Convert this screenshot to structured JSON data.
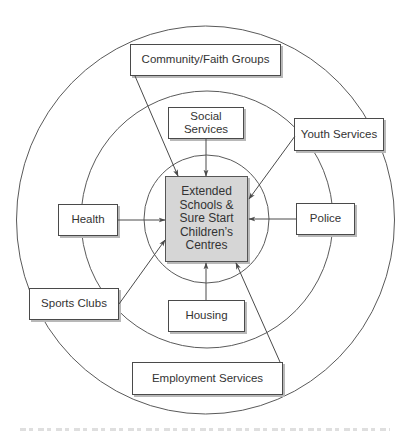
{
  "diagram": {
    "type": "concentric-hub-and-spoke",
    "colors": {
      "line": "#4a4a4a",
      "box_fill": "#ffffff",
      "center_fill": "#d6d6d6",
      "shadow": "#b8b8b8"
    },
    "rings": [
      {
        "name": "outer",
        "cx": 205.5,
        "cy": 220,
        "rx": 189,
        "ry": 194
      },
      {
        "name": "middle",
        "cx": 207,
        "cy": 219.5,
        "rx": 126,
        "ry": 128.5
      },
      {
        "name": "inner",
        "cx": 206.5,
        "cy": 219,
        "rx": 62.5,
        "ry": 64
      }
    ],
    "center": {
      "lines": [
        "Extended",
        "Schools &",
        "Sure Start",
        "Children’s",
        "Centres"
      ]
    },
    "nodes": [
      {
        "id": "community-faith-groups",
        "label": "Community/Faith Groups",
        "ring": "outer"
      },
      {
        "id": "social-services",
        "label": "Social Services",
        "ring": "middle"
      },
      {
        "id": "youth-services",
        "label": "Youth Services",
        "ring": "middle/outer"
      },
      {
        "id": "health",
        "label": "Health",
        "ring": "middle"
      },
      {
        "id": "police",
        "label": "Police",
        "ring": "middle"
      },
      {
        "id": "sports-clubs",
        "label": "Sports Clubs",
        "ring": "middle/outer"
      },
      {
        "id": "housing",
        "label": "Housing",
        "ring": "middle"
      },
      {
        "id": "employment-services",
        "label": "Employment Services",
        "ring": "outer"
      }
    ],
    "edges": [
      {
        "from": "community-faith-groups",
        "to": "center"
      },
      {
        "from": "social-services",
        "to": "center"
      },
      {
        "from": "youth-services",
        "to": "center"
      },
      {
        "from": "health",
        "to": "center"
      },
      {
        "from": "police",
        "to": "center"
      },
      {
        "from": "sports-clubs",
        "to": "center"
      },
      {
        "from": "housing",
        "to": "center"
      },
      {
        "from": "employment-services",
        "to": "center"
      }
    ]
  }
}
